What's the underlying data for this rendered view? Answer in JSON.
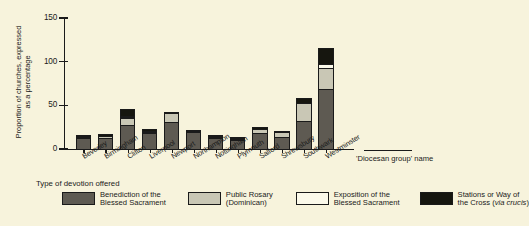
{
  "chart_data": {
    "type": "bar",
    "subtype": "stacked-bar",
    "title": "",
    "xlabel": "'Diocesan group' name",
    "ylabel": "Proportion of churches, expressed as a percentage",
    "ylim": [
      0,
      150
    ],
    "yticks": [
      0,
      50,
      100,
      150
    ],
    "ytick_labels": [
      "0",
      "50",
      "100",
      "150"
    ],
    "grid": false,
    "legend_title": "Type of devotion offered",
    "legend_position": "below",
    "categories": [
      "Beverley",
      "Birmingham",
      "Clifton",
      "Liverpool",
      "Newport",
      "Northampton",
      "Nottingham",
      "Plymouth",
      "Salford",
      "Shrewsbury",
      "Southwark",
      "Westminster"
    ],
    "series": [
      {
        "name": "Benediction of the Blessed Sacrament",
        "color": "#5e5a52",
        "values": [
          14,
          14,
          28,
          19,
          32,
          20,
          14,
          11,
          19,
          15,
          33,
          70
        ]
      },
      {
        "name": "Public Rosary (Dominican)",
        "color": "#c9c7b5",
        "values": [
          2,
          3,
          10,
          3,
          11,
          3,
          2,
          3,
          6,
          6,
          22,
          25
        ]
      },
      {
        "name": "Exposition of the Blessed Sacrament",
        "color": "#fbf9ea",
        "values": [
          0,
          0,
          2,
          0,
          0,
          0,
          0,
          0,
          0,
          0,
          0,
          5
        ]
      },
      {
        "name": "Stations or Way of the Cross (via crucis)",
        "color": "#16160f",
        "values": [
          2,
          3,
          10,
          4,
          3,
          2,
          2,
          1,
          3,
          2,
          7,
          20
        ]
      }
    ],
    "totals": [
      18,
      20,
      50,
      26,
      46,
      25,
      18,
      15,
      28,
      23,
      62,
      120
    ]
  },
  "axes": {
    "y_title_line1": "Proportion of churches,",
    "y_title_line2": "expressed as a percentage",
    "x_title": "'Diocesan group' name"
  },
  "legend": {
    "title": "Type of devotion offered",
    "entries": [
      {
        "line1": "Benediction of the",
        "line2": "Blessed Sacrament",
        "swatch": "s0"
      },
      {
        "line1": "Public Rosary",
        "line2": "(Dominican)",
        "swatch": "s1"
      },
      {
        "line1": "Exposition of the",
        "line2": "Blessed Sacrament",
        "swatch": "s2"
      },
      {
        "line1": "Stations or Way of",
        "line2": "the Cross (",
        "line2_italic": "via crucis",
        "line2_end": ")",
        "swatch": "s3"
      }
    ]
  }
}
